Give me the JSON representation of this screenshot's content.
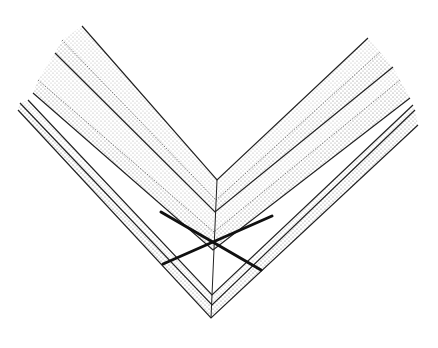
{
  "figure": {
    "colors": {
      "background": "#ffffff",
      "line": "#222222",
      "bold": "#111111",
      "stipple": "#555555"
    },
    "chevrons": [
      {
        "left": [
          82,
          26
        ],
        "apex": [
          217,
          180
        ],
        "right": [
          368,
          38
        ],
        "style": "solid"
      },
      {
        "left": [
          62,
          40
        ],
        "apex": [
          216,
          200
        ],
        "right": [
          380,
          52
        ],
        "style": "stipple-edge"
      },
      {
        "left": [
          55,
          53
        ],
        "apex": [
          215,
          212
        ],
        "right": [
          393,
          67
        ],
        "style": "solid"
      },
      {
        "left": [
          38,
          80
        ],
        "apex": [
          214,
          232
        ],
        "right": [
          400,
          80
        ],
        "style": "stipple-edge"
      },
      {
        "left": [
          33,
          93
        ],
        "apex": [
          213,
          250
        ],
        "right": [
          410,
          98
        ],
        "style": "solid"
      },
      {
        "left": [
          28,
          100
        ],
        "apex": [
          212,
          295
        ],
        "right": [
          413,
          105
        ],
        "style": "solid"
      },
      {
        "left": [
          20,
          103
        ],
        "apex": [
          212,
          305
        ],
        "right": [
          415,
          110
        ],
        "style": "solid"
      },
      {
        "left": [
          18,
          110
        ],
        "apex": [
          211,
          318
        ],
        "right": [
          418,
          125
        ],
        "style": "solid"
      }
    ],
    "axial_line": {
      "from": [
        217,
        180
      ],
      "to": [
        211,
        318
      ]
    },
    "cross_lines": [
      {
        "from": [
          161,
          212
        ],
        "to": [
          261,
          270
        ]
      },
      {
        "from": [
          163,
          264
        ],
        "to": [
          272,
          216
        ]
      }
    ]
  }
}
